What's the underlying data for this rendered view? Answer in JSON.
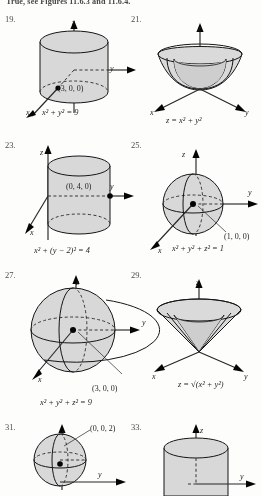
{
  "page": {
    "header_text": "True, see Figures 11.6.3 and 11.6.4.",
    "background_color": "#fdfdfc",
    "surface_fill": "#d9d9d9",
    "line_color": "#111111"
  },
  "axis_labels": {
    "x": "x",
    "y": "y",
    "z": "z"
  },
  "figures": [
    {
      "number": "19.",
      "shape": "cylinder",
      "equation": "x² + y² = 9",
      "point_label": "(3, 0, 0)",
      "axes": [
        "x",
        "y",
        "z"
      ]
    },
    {
      "number": "21.",
      "shape": "paraboloid",
      "equation": "z = x² + y²",
      "point_label": "",
      "axes": [
        "x",
        "y",
        "z"
      ]
    },
    {
      "number": "23.",
      "shape": "cylinder",
      "equation": "x² + (y − 2)² = 4",
      "point_label": "(0, 4, 0)",
      "axes": [
        "x",
        "y",
        "z"
      ]
    },
    {
      "number": "25.",
      "shape": "sphere",
      "equation": "x² + y² + z² = 1",
      "point_label": "(1, 0, 0)",
      "axes": [
        "x",
        "y",
        "z"
      ]
    },
    {
      "number": "27.",
      "shape": "sphere",
      "equation": "x² + y² + z² = 9",
      "point_label": "(3, 0, 0)",
      "axes": [
        "x",
        "y",
        "z"
      ]
    },
    {
      "number": "29.",
      "shape": "cone",
      "equation": "z = √(x² + y²)",
      "point_label": "",
      "axes": [
        "x",
        "y",
        "z"
      ]
    },
    {
      "number": "31.",
      "shape": "sphere",
      "equation": "",
      "point_label": "(0, 0, 2)",
      "axes": [
        "y",
        "z"
      ]
    },
    {
      "number": "33.",
      "shape": "cylinder",
      "equation": "",
      "point_label": "",
      "axes": [
        "y",
        "z"
      ]
    }
  ]
}
